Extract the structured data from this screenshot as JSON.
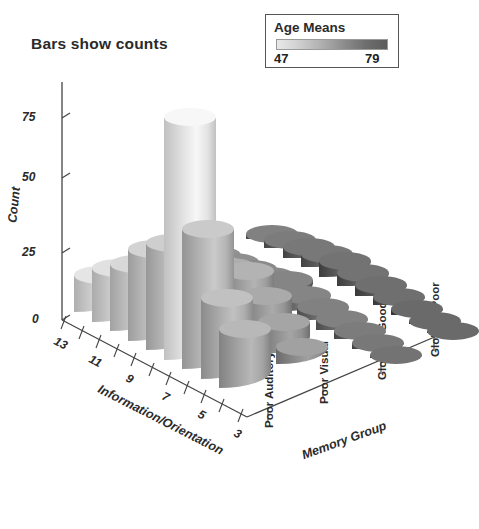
{
  "chart_data": {
    "type": "bar",
    "subtype": "3d-cylinder-bar",
    "title": "Bars show counts",
    "xlabel": "Information/Orientation",
    "ylabel": "Count",
    "zlabel": "Memory Group",
    "ylim": [
      0,
      100
    ],
    "yticks": [
      0,
      25,
      50,
      75
    ],
    "ytick_labels": [
      "0",
      "25",
      "50",
      "75"
    ],
    "xticks": [
      13,
      11,
      9,
      7,
      5,
      3
    ],
    "xtick_labels": [
      "13",
      "11",
      "9",
      "7",
      "5",
      "3"
    ],
    "grid": false,
    "legend": {
      "title": "Age Means",
      "min_label": "47",
      "max_label": "79",
      "min_value": 47,
      "max_value": 79,
      "position": "top-right",
      "ramp_from": "#e8e8e8",
      "ramp_to": "#5c5c5c"
    },
    "categories_z": [
      "Poor Auditory",
      "Poor Visual",
      "Globally Good",
      "Globally Poor"
    ],
    "categories_x": [
      "13",
      "12",
      "11",
      "10",
      "9",
      "8",
      "7",
      "6",
      "5",
      "4",
      "3"
    ],
    "series": [
      {
        "name": "Poor Auditory",
        "counts": [
          14,
          20,
          25,
          34,
          40,
          90,
          52,
          30,
          22,
          0,
          0
        ],
        "age_means": [
          52,
          53,
          55,
          56,
          57,
          48,
          58,
          60,
          62,
          0,
          0
        ]
      },
      {
        "name": "Poor Visual",
        "counts": [
          10,
          14,
          17,
          20,
          22,
          24,
          18,
          12,
          6,
          0,
          0
        ],
        "age_means": [
          60,
          61,
          62,
          63,
          64,
          63,
          65,
          66,
          67,
          0,
          0
        ]
      },
      {
        "name": "Globally Good",
        "counts": [
          3,
          4,
          5,
          6,
          8,
          6,
          5,
          4,
          3,
          2,
          1
        ],
        "age_means": [
          70,
          71,
          72,
          72,
          73,
          73,
          74,
          74,
          75,
          76,
          77
        ]
      },
      {
        "name": "Globally Poor",
        "counts": [
          2,
          3,
          4,
          5,
          6,
          5,
          4,
          3,
          2,
          1,
          1
        ],
        "age_means": [
          74,
          75,
          76,
          76,
          77,
          77,
          78,
          78,
          79,
          79,
          79
        ]
      }
    ]
  },
  "chart": {
    "title": "Bars show counts",
    "y_axis": {
      "label": "Count",
      "ticks": [
        "75",
        "50",
        "25",
        "0"
      ]
    },
    "x_axis": {
      "label": "Information/Orientation",
      "ticks": [
        "13",
        "11",
        "9",
        "7",
        "5",
        "3"
      ]
    },
    "z_axis": {
      "label": "Memory Group",
      "ticks": [
        "Poor Auditory",
        "Poor Visual",
        "Globally Good",
        "Globally Poor"
      ]
    },
    "legend": {
      "title": "Age Means",
      "min": "47",
      "max": "79"
    }
  }
}
